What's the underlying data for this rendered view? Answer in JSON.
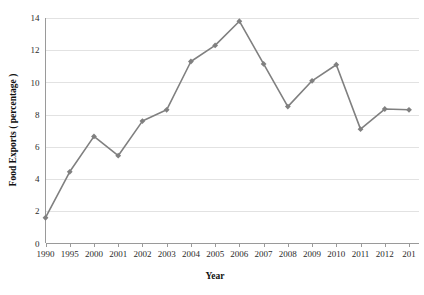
{
  "chart_data": {
    "type": "line",
    "title": "",
    "xlabel": "Year",
    "ylabel": "Food Exports ( percentage )",
    "categories": [
      "1990",
      "1995",
      "2000",
      "2001",
      "2002",
      "2003",
      "2004",
      "2005",
      "2006",
      "2007",
      "2008",
      "2009",
      "2010",
      "2011",
      "2012",
      "2013"
    ],
    "tick_labels_displayed": [
      "1990",
      "1995",
      "2000",
      "2001",
      "2002",
      "2003",
      "2004",
      "2005",
      "2006",
      "2007",
      "2008",
      "2009",
      "2010",
      "2011",
      "2012",
      "201"
    ],
    "series": [
      {
        "name": "Food Exports",
        "values": [
          1.6,
          4.45,
          6.65,
          5.45,
          7.6,
          8.3,
          11.3,
          12.3,
          13.8,
          11.15,
          8.5,
          10.1,
          11.1,
          7.1,
          8.35,
          8.3
        ]
      }
    ],
    "ylim": [
      0,
      14
    ],
    "yticks": [
      0,
      2,
      4,
      6,
      8,
      10,
      12,
      14
    ],
    "ytick_labels": [
      "0",
      "2",
      "4",
      "6",
      "8",
      "10",
      "12",
      "14"
    ],
    "grid": "horizontal",
    "legend": "none",
    "marker": "diamond",
    "colors": {
      "series": "#808080",
      "gridline": "#e2e2e2",
      "axis": "#9a9a9a",
      "text": "#2b2b2b",
      "background": "#ffffff"
    }
  },
  "axes": {
    "y_title": "Food Exports ( percentage )",
    "x_title": "Year"
  }
}
